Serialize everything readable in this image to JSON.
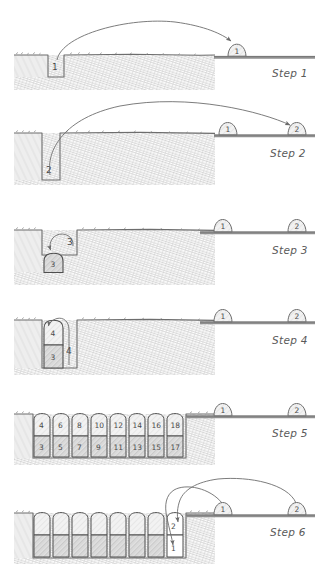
{
  "document": {
    "type": "hand-drawn instructional diagram",
    "title_visible": false,
    "panel_count": 6,
    "background_color": "#ffffff",
    "ink_color": "#555555",
    "hatch_color": "#9a9a9a"
  },
  "panels": [
    {
      "id": "step-1",
      "label": "Step 1",
      "ground_hole_label": "1",
      "surface_blocks": [
        {
          "label": "1"
        }
      ],
      "arrow": {
        "from": "hole",
        "to": "surface-block-1",
        "style": "curved"
      },
      "hole_depth_units": 1,
      "trench_blocks": []
    },
    {
      "id": "step-2",
      "label": "Step 2",
      "ground_hole_label": "2",
      "surface_blocks": [
        {
          "label": "1"
        },
        {
          "label": "2"
        }
      ],
      "arrow": {
        "from": "hole",
        "to": "surface-block-2",
        "style": "curved"
      },
      "hole_depth_units": 2,
      "trench_blocks": []
    },
    {
      "id": "step-3",
      "label": "Step 3",
      "ground_hole_label": "3",
      "surface_blocks": [
        {
          "label": "1"
        },
        {
          "label": "2"
        }
      ],
      "arrow": {
        "from": "above-hole",
        "to": "hole-bottom",
        "style": "short-loop"
      },
      "hole_depth_units": 1,
      "trench_blocks": [
        {
          "label": "3",
          "row": "bottom",
          "col": 0
        }
      ]
    },
    {
      "id": "step-4",
      "label": "Step 4",
      "ground_hole_label": "4",
      "surface_blocks": [
        {
          "label": "1"
        },
        {
          "label": "2"
        }
      ],
      "arrow": {
        "from": "trench-right",
        "to": "trench-top-left",
        "style": "hook"
      },
      "hole_depth_units": 2,
      "trench_blocks": [
        {
          "label": "4",
          "row": "top",
          "col": 0
        },
        {
          "label": "3",
          "row": "bottom",
          "col": 0
        }
      ]
    },
    {
      "id": "step-5",
      "label": "Step 5",
      "ground_hole_label": "",
      "surface_blocks": [
        {
          "label": "1"
        },
        {
          "label": "2"
        }
      ],
      "arrow": null,
      "hole_depth_units": 2,
      "trench_rows": {
        "top": [
          "4",
          "6",
          "8",
          "10",
          "12",
          "14",
          "16",
          "18"
        ],
        "bottom": [
          "3",
          "5",
          "7",
          "9",
          "11",
          "13",
          "15",
          "17"
        ]
      }
    },
    {
      "id": "step-6",
      "label": "Step 6",
      "ground_hole_label": "",
      "surface_blocks": [
        {
          "label": "1"
        },
        {
          "label": "2"
        }
      ],
      "arrows": [
        {
          "from": "surface-block-1",
          "to": "trench-last-bottom",
          "label": "1"
        },
        {
          "from": "surface-block-2",
          "to": "trench-last-top",
          "label": "2"
        }
      ],
      "hole_depth_units": 2,
      "final_blocks": [
        {
          "label": "2",
          "row": "top"
        },
        {
          "label": "1",
          "row": "bottom"
        }
      ],
      "trench_rows": {
        "top": [
          "",
          "",
          "",
          "",
          "",
          "",
          "",
          "2"
        ],
        "bottom": [
          "",
          "",
          "",
          "",
          "",
          "",
          "",
          "1"
        ]
      }
    }
  ],
  "step_labels": {
    "step1": "Step 1",
    "step2": "Step 2",
    "step3": "Step 3",
    "step4": "Step 4",
    "step5": "Step 5",
    "step6": "Step 6"
  },
  "numbers": {
    "n1": "1",
    "n2": "2",
    "n3": "3",
    "n4": "4",
    "n5": "5",
    "n6": "6",
    "n7": "7",
    "n8": "8",
    "n9": "9",
    "n10": "10",
    "n11": "11",
    "n12": "12",
    "n13": "13",
    "n14": "14",
    "n15": "15",
    "n16": "16",
    "n17": "17",
    "n18": "18"
  }
}
